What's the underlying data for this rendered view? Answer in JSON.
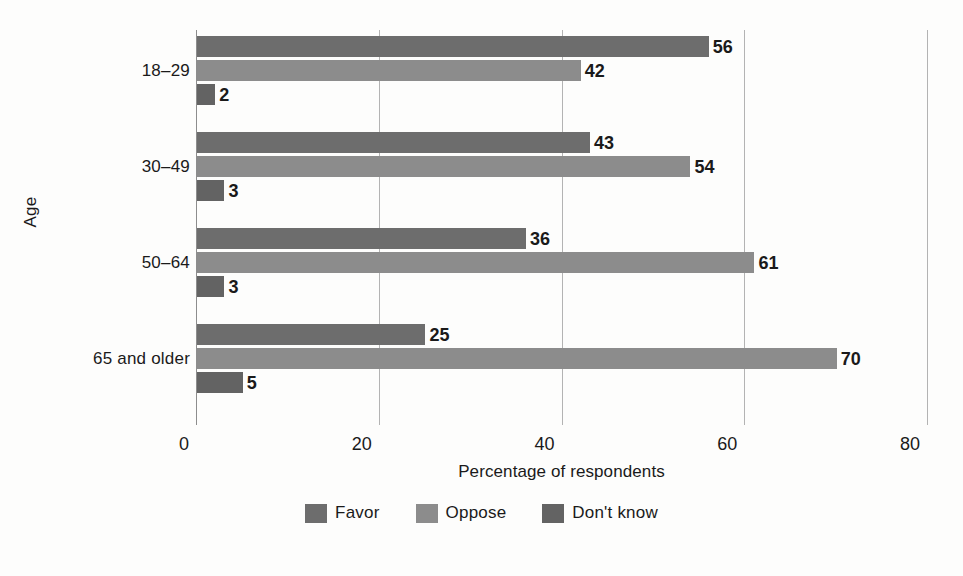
{
  "chart_data": {
    "type": "bar",
    "orientation": "horizontal",
    "title": "",
    "xlabel": "Percentage of respondents",
    "ylabel": "Age",
    "xlim": [
      0,
      80
    ],
    "xticks": [
      0,
      20,
      40,
      60,
      80
    ],
    "xtick_labels": [
      "0",
      "20",
      "40",
      "60",
      "80"
    ],
    "grid": true,
    "grid_axis": "x",
    "legend_position": "bottom-center",
    "categories": [
      "18–29",
      "30–49",
      "50–64",
      "65 and older"
    ],
    "series": [
      {
        "name": "Favor",
        "color": "#6d6d6d",
        "values": [
          56,
          43,
          36,
          25
        ]
      },
      {
        "name": "Oppose",
        "color": "#8c8c8c",
        "values": [
          42,
          54,
          61,
          70
        ]
      },
      {
        "name": "Don't know",
        "color": "#636363",
        "values": [
          2,
          3,
          3,
          5
        ]
      }
    ],
    "data_labels": [
      [
        "56",
        "42",
        "2"
      ],
      [
        "43",
        "54",
        "3"
      ],
      [
        "36",
        "61",
        "3"
      ],
      [
        "25",
        "70",
        "5"
      ]
    ],
    "value_label_suffix": ""
  },
  "axes": {
    "y_title": "Age",
    "x_title": "Percentage of respondents"
  },
  "legend": {
    "items": [
      {
        "label": "Favor",
        "color": "#6d6d6d"
      },
      {
        "label": "Oppose",
        "color": "#8c8c8c"
      },
      {
        "label": "Don't know",
        "color": "#636363"
      }
    ]
  },
  "colors": {
    "background": "#fdfdfc",
    "text": "#1a1a1a",
    "gridline": "#b3b3b3",
    "axis": "#8d8d8d"
  }
}
